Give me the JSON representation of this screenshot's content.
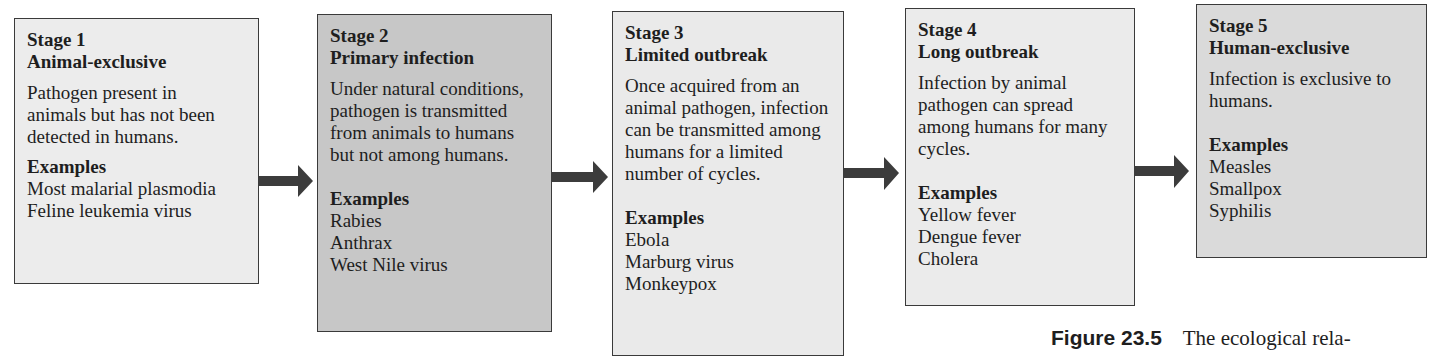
{
  "colors": {
    "box_light": "#ebebeb",
    "box_medium": "#c7c7c7",
    "box_mid_light": "#dadada",
    "border": "#3a3a3a",
    "arrow": "#3c3c3c",
    "text": "#1e1e1e"
  },
  "stages": [
    {
      "number": "Stage 1",
      "title": "Animal-exclusive",
      "description": "Pathogen present in animals but has not been detected in humans.",
      "examples_heading": "Examples",
      "examples": [
        "Most malarial plasmodia",
        "Feline leukemia virus"
      ]
    },
    {
      "number": "Stage 2",
      "title": "Primary infection",
      "description": "Under natural conditions, pathogen is transmitted from animals to humans but not among humans.",
      "examples_heading": "Examples",
      "examples": [
        "Rabies",
        "Anthrax",
        "West Nile virus"
      ]
    },
    {
      "number": "Stage 3",
      "title": "Limited outbreak",
      "description": "Once acquired from an animal pathogen, infection can be transmitted among humans for a limited number of cycles.",
      "examples_heading": "Examples",
      "examples": [
        "Ebola",
        "Marburg virus",
        "Monkeypox"
      ]
    },
    {
      "number": "Stage 4",
      "title": "Long outbreak",
      "description": "Infection by animal pathogen can spread among humans for many cycles.",
      "examples_heading": "Examples",
      "examples": [
        "Yellow fever",
        "Dengue fever",
        "Cholera"
      ]
    },
    {
      "number": "Stage 5",
      "title": "Human-exclusive",
      "description": "Infection is exclusive to humans.",
      "examples_heading": "Examples",
      "examples": [
        "Measles",
        "Smallpox",
        "Syphilis"
      ]
    }
  ],
  "arrows": [
    {
      "from": "Stage 1",
      "to": "Stage 2"
    },
    {
      "from": "Stage 2",
      "to": "Stage 3"
    },
    {
      "from": "Stage 3",
      "to": "Stage 4"
    },
    {
      "from": "Stage 4",
      "to": "Stage 5"
    }
  ],
  "caption": {
    "label": "Figure 23.5",
    "text": "The ecological rela-"
  }
}
